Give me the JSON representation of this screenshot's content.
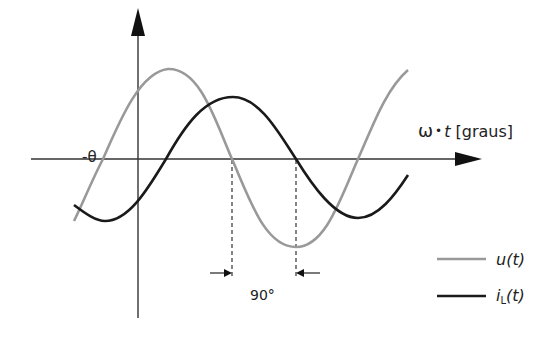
{
  "diagram": {
    "title": "",
    "x_axis_label": {
      "omega": "ω",
      "dot": "•",
      "t": "t",
      "unit": " [graus]"
    },
    "theta_label": "-θ",
    "phase_label": "90°",
    "legend": [
      {
        "name": "u(t)",
        "color": "#999999"
      },
      {
        "name": "i",
        "sub": "L",
        "suffix": "(t)",
        "color": "#1a1a1a"
      }
    ],
    "colors": {
      "axis": "#333333",
      "voltage": "#999999",
      "current": "#1a1a1a"
    }
  }
}
